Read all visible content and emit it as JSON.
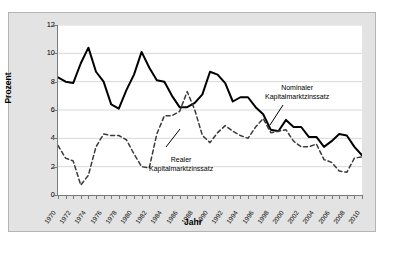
{
  "chart_data": {
    "type": "line",
    "title": "",
    "xlabel": "Jahr",
    "ylabel": "Prozent",
    "xlim": [
      1970,
      2010
    ],
    "ylim": [
      0,
      12
    ],
    "ytick_step": 2,
    "xtick_step": 2,
    "grid": "horizontal",
    "legend_position": "inline-annotations",
    "x": [
      1970,
      1971,
      1972,
      1973,
      1974,
      1975,
      1976,
      1977,
      1978,
      1979,
      1980,
      1981,
      1982,
      1983,
      1984,
      1985,
      1986,
      1987,
      1988,
      1989,
      1990,
      1991,
      1992,
      1993,
      1994,
      1995,
      1996,
      1997,
      1998,
      1999,
      2000,
      2001,
      2002,
      2003,
      2004,
      2005,
      2006,
      2007,
      2008,
      2009,
      2010
    ],
    "ytick_labels": [
      "0",
      "2",
      "4",
      "6",
      "8",
      "10",
      "12"
    ],
    "xtick_labels": [
      "1970",
      "1972",
      "1974",
      "1976",
      "1978",
      "1980",
      "1982",
      "1984",
      "1986",
      "1988",
      "1990",
      "1992",
      "1994",
      "1996",
      "1998",
      "2000",
      "2002",
      "2004",
      "2006",
      "2008",
      "2010"
    ],
    "series": [
      {
        "name": "Nominaler Kapitalmarktzinssatz",
        "style": "solid",
        "color": "#000000",
        "values": [
          8.3,
          8.0,
          7.9,
          9.3,
          10.4,
          8.7,
          8.0,
          6.4,
          6.1,
          7.4,
          8.5,
          10.1,
          9.0,
          8.1,
          8.0,
          7.0,
          6.2,
          6.2,
          6.5,
          7.1,
          8.7,
          8.5,
          7.9,
          6.6,
          6.9,
          6.9,
          6.2,
          5.7,
          4.6,
          4.5,
          5.3,
          4.8,
          4.8,
          4.1,
          4.1,
          3.4,
          3.8,
          4.3,
          4.2,
          3.4,
          2.8
        ]
      },
      {
        "name": "Realer Kapitalmarktzinssatz",
        "style": "dashed",
        "color": "#3a3a3a",
        "values": [
          3.5,
          2.6,
          2.4,
          0.7,
          1.4,
          3.4,
          4.3,
          4.2,
          4.2,
          3.9,
          2.9,
          2.0,
          1.9,
          4.3,
          5.6,
          5.6,
          5.9,
          7.3,
          6.0,
          4.2,
          3.7,
          4.4,
          4.9,
          4.5,
          4.2,
          4.0,
          4.8,
          5.4,
          4.4,
          4.5,
          4.6,
          3.8,
          3.4,
          3.4,
          3.6,
          2.5,
          2.3,
          1.7,
          1.6,
          2.6,
          2.7
        ]
      }
    ],
    "annotations": [
      {
        "id": "nominal",
        "line1": "Nominaler",
        "line2": "Kapitalmarktzinssatz"
      },
      {
        "id": "real",
        "line1": "Realer",
        "line2": "Kapitalmarktzinssatz"
      }
    ]
  }
}
